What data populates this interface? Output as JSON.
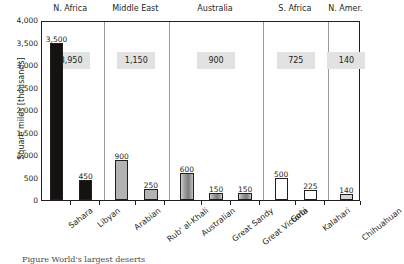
{
  "chart_data": {
    "type": "bar",
    "title": "",
    "subtitle": "",
    "xlabel": "",
    "ylabel": "Square miles [thousands]",
    "ylim": [
      0,
      4000
    ],
    "ytick_labels": [
      "0",
      "500",
      "1,000",
      "1,500",
      "2,000",
      "2,500",
      "3,000",
      "3,500",
      "4,000"
    ],
    "ytick_values": [
      0,
      500,
      1000,
      1500,
      2000,
      2500,
      3000,
      3500,
      4000
    ],
    "grid": false,
    "legend": "none",
    "categories": [
      "Sahara",
      "Libyan",
      "Arabian",
      "Rub' al-Khali",
      "Australian",
      "Great Sandy",
      "Great Victoria",
      "Gobi",
      "Kalahari",
      "Chihuahuan"
    ],
    "values": [
      3500,
      450,
      900,
      250,
      600,
      150,
      150,
      500,
      225,
      140
    ],
    "value_labels": [
      "3,500",
      "450",
      "900",
      "250",
      "600",
      "150",
      "150",
      "500",
      "225",
      "140"
    ],
    "groups": [
      {
        "label": "N. Africa",
        "total": 3950,
        "total_label": "3,950",
        "members": [
          "Sahara",
          "Libyan"
        ]
      },
      {
        "label": "Middle East",
        "total": 1150,
        "total_label": "1,150",
        "members": [
          "Arabian",
          "Rub' al-Khali"
        ]
      },
      {
        "label": "Australia",
        "total": 900,
        "total_label": "900",
        "members": [
          "Australian",
          "Great Sandy",
          "Great Victoria"
        ]
      },
      {
        "label": "S. Africa",
        "total": 725,
        "total_label": "725",
        "members": [
          "Gobi",
          "Kalahari"
        ]
      },
      {
        "label": "N. Amer.",
        "total": 140,
        "total_label": "140",
        "members": [
          "Chihuahuan"
        ]
      }
    ],
    "bar_styles": [
      "black",
      "black",
      "gray",
      "gray",
      "shaded",
      "shaded",
      "shaded",
      "white",
      "white",
      "light"
    ],
    "colors": {
      "bar_black": "#15120f",
      "bar_gray": "#b3b3b3",
      "bar_white": "#ffffff",
      "bar_light": "#d5d5d5",
      "total_box": "#e2e2e2",
      "axis": "#231f20",
      "separator": "#9a9a9a"
    }
  },
  "caption": {
    "text": "Figure     World's largest deserts"
  }
}
